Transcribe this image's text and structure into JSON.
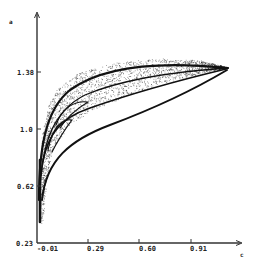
{
  "chart_data": {
    "type": "scatter",
    "title": "",
    "xlabel": "c",
    "ylabel": "a",
    "x_ticks": [
      -0.01,
      0.29,
      0.6,
      0.91
    ],
    "x_tick_labels": [
      "-0.01",
      "0.29",
      "0.60",
      "0.91"
    ],
    "y_ticks": [
      0.23,
      0.62,
      1.0,
      1.38
    ],
    "y_tick_labels": [
      "0.23",
      "0.62",
      "1.0",
      "1.38"
    ],
    "xlim": [
      -0.01,
      1.15
    ],
    "ylim": [
      0.23,
      1.62
    ],
    "grid": false,
    "legend": null,
    "envelope": {
      "upper_boundary": [
        [
          0.0,
          0.55
        ],
        [
          0.02,
          0.95
        ],
        [
          0.06,
          1.16
        ],
        [
          0.12,
          1.28
        ],
        [
          0.25,
          1.38
        ],
        [
          0.45,
          1.44
        ],
        [
          0.7,
          1.47
        ],
        [
          0.95,
          1.46
        ],
        [
          1.13,
          1.41
        ]
      ],
      "lower_boundary": [
        [
          0.02,
          0.35
        ],
        [
          0.04,
          0.62
        ],
        [
          0.08,
          0.85
        ],
        [
          0.18,
          1.02
        ],
        [
          0.35,
          1.14
        ],
        [
          0.55,
          1.23
        ],
        [
          0.8,
          1.32
        ],
        [
          1.0,
          1.38
        ],
        [
          1.13,
          1.41
        ]
      ],
      "bottom_tip": [
        0.01,
        0.36
      ],
      "right_tip": [
        1.13,
        1.41
      ]
    },
    "point_color": "#111111"
  },
  "axes": {
    "x_label": "c",
    "y_label": "a"
  }
}
